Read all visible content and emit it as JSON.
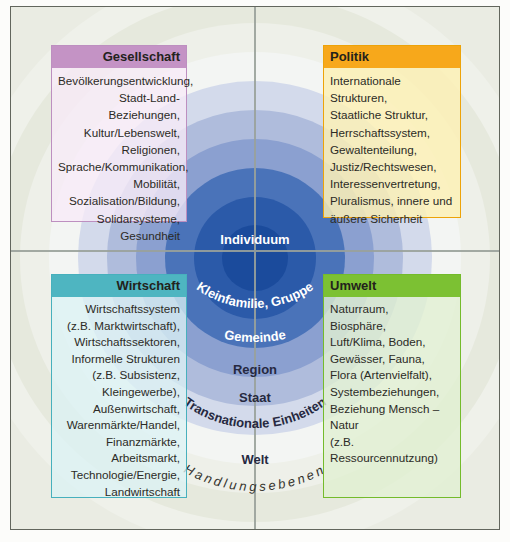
{
  "diagram": {
    "center_label": "Individuum",
    "ring_labels": {
      "level2": "Kleinfamilie, Gruppe",
      "level3": "Gemeinde",
      "level4": "Region",
      "level5": "Staat",
      "level6": "Transnationale Einheiten",
      "level7": "Welt",
      "axis": "Handlungsebenen"
    },
    "ring_colors": [
      "#eff1ea",
      "#e6e9dd",
      "#eef0e9",
      "#f3f5f3",
      "#d3daeb",
      "#afbcdc",
      "#8ba0d0",
      "#4a73b9",
      "#2b5aa9",
      "#1b4b9c"
    ]
  },
  "quadrants": {
    "gesellschaft": {
      "title": "Gesellschaft",
      "header_color": "#c493c5",
      "lines": [
        "Bevölkerungsentwicklung,",
        "Stadt-Land-Beziehungen,",
        "Kultur/Lebenswelt,",
        "Religionen,",
        "Sprache/Kommunikation,",
        "Mobilität,",
        "Sozialisation/Bildung,",
        "Solidarsysteme,",
        "Gesundheit"
      ]
    },
    "politik": {
      "title": "Politik",
      "header_color": "#f7a81b",
      "lines": [
        "Internationale Strukturen,",
        "Staatliche Struktur,",
        "Herrschaftssystem,",
        "Gewaltenteilung,",
        "Justiz/Rechtswesen,",
        "Interessenvertretung,",
        "Pluralismus, innere und",
        "äußere Sicherheit"
      ]
    },
    "wirtschaft": {
      "title": "Wirtschaft",
      "header_color": "#4eb5c1",
      "lines": [
        "Wirtschaftssystem",
        "(z.B. Marktwirtschaft),",
        "Wirtschaftssektoren,",
        "Informelle Strukturen",
        "(z.B. Subsistenz,",
        "Kleingewerbe),",
        "Außenwirtschaft,",
        "Warenmärkte/Handel,",
        "Finanzmärkte,",
        "Arbeitsmarkt,",
        "Technologie/Energie,",
        "Landwirtschaft"
      ]
    },
    "umwelt": {
      "title": "Umwelt",
      "header_color": "#7cc133",
      "lines": [
        "Naturraum,",
        "Biosphäre,",
        "Luft/Klima, Boden,",
        "Gewässer, Fauna,",
        "Flora (Artenvielfalt),",
        "Systembeziehungen,",
        "Beziehung Mensch – Natur",
        "(z.B. Ressourcennutzung)"
      ]
    }
  }
}
